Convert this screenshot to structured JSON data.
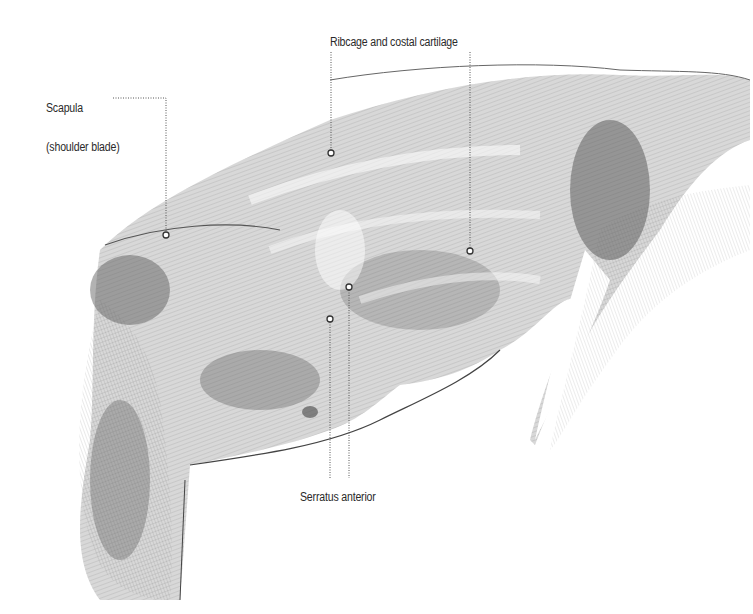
{
  "figure": {
    "labels": [
      {
        "id": "ribcage",
        "text": "Ribcage and costal cartilage",
        "x": 330,
        "y": 36
      },
      {
        "id": "scapula",
        "line1": "Scapula",
        "line2": "(shoulder blade)",
        "x": 46,
        "y": 76
      },
      {
        "id": "serratus",
        "text": "Serratus anterior",
        "x": 300,
        "y": 491
      }
    ],
    "markers": [
      {
        "id": "scapula-point",
        "x": 166,
        "y": 235
      },
      {
        "id": "ribcage-point-1",
        "x": 331,
        "y": 153
      },
      {
        "id": "ribcage-point-2",
        "x": 470,
        "y": 251
      },
      {
        "id": "serratus-point-1",
        "x": 349,
        "y": 287
      },
      {
        "id": "serratus-point-2",
        "x": 330,
        "y": 319
      }
    ],
    "colors": {
      "ink": "#2a2a2a",
      "leader": "#555555",
      "background": "#ffffff"
    }
  }
}
